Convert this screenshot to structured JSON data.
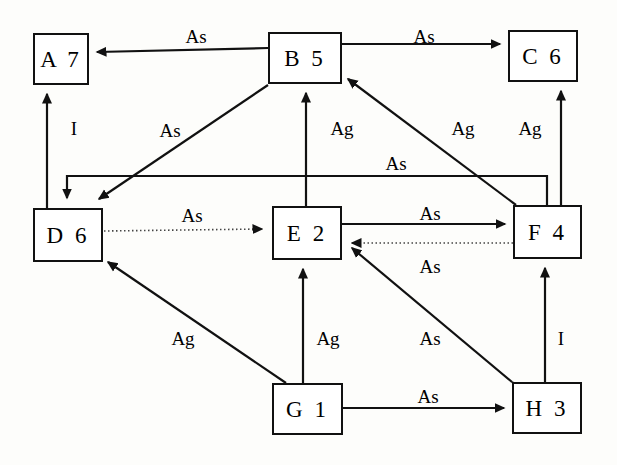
{
  "diagram": {
    "width": 617,
    "height": 465,
    "background_color": "#fdfdfb",
    "line_color": "#111111",
    "text_color": "#000000"
  },
  "nodes": [
    {
      "id": "A",
      "label": "A  7",
      "letter": "A",
      "number": "7",
      "x": 33,
      "y": 33,
      "w": 56,
      "h": 52
    },
    {
      "id": "B",
      "label": "B  5",
      "letter": "B",
      "number": "5",
      "x": 268,
      "y": 32,
      "w": 74,
      "h": 52
    },
    {
      "id": "C",
      "label": "C  6",
      "letter": "C",
      "number": "6",
      "x": 508,
      "y": 30,
      "w": 70,
      "h": 52
    },
    {
      "id": "D",
      "label": "D  6",
      "letter": "D",
      "number": "6",
      "x": 33,
      "y": 208,
      "w": 70,
      "h": 54
    },
    {
      "id": "E",
      "label": "E  2",
      "letter": "E",
      "number": "2",
      "x": 272,
      "y": 206,
      "w": 70,
      "h": 54
    },
    {
      "id": "F",
      "label": "F  4",
      "letter": "F",
      "number": "4",
      "x": 513,
      "y": 205,
      "w": 69,
      "h": 54
    },
    {
      "id": "G",
      "label": "G  1",
      "letter": "G",
      "number": "1",
      "x": 272,
      "y": 383,
      "w": 71,
      "h": 52
    },
    {
      "id": "H",
      "label": "H  3",
      "letter": "H",
      "number": "3",
      "x": 512,
      "y": 382,
      "w": 70,
      "h": 52
    }
  ],
  "edges": [
    {
      "id": "b-a",
      "from": "B",
      "to": "A",
      "label": "As",
      "style": "solid",
      "label_x": 196,
      "label_y": 36
    },
    {
      "id": "b-c",
      "from": "B",
      "to": "C",
      "label": "As",
      "style": "solid",
      "label_x": 424,
      "label_y": 36
    },
    {
      "id": "d-a",
      "from": "D",
      "to": "A",
      "label": "I",
      "style": "solid",
      "label_x": 74,
      "label_y": 128
    },
    {
      "id": "b-d",
      "from": "B",
      "to": "D",
      "label": "As",
      "style": "solid",
      "label_x": 170,
      "label_y": 130
    },
    {
      "id": "e-b",
      "from": "E",
      "to": "B",
      "label": "Ag",
      "style": "solid",
      "label_x": 342,
      "label_y": 128
    },
    {
      "id": "f-b",
      "from": "F",
      "to": "B",
      "label": "Ag",
      "style": "solid",
      "label_x": 463,
      "label_y": 128
    },
    {
      "id": "f-c",
      "from": "F",
      "to": "C",
      "label": "Ag",
      "style": "solid",
      "label_x": 530,
      "label_y": 128
    },
    {
      "id": "f-d",
      "from": "F",
      "to": "D",
      "label": "As",
      "style": "solid",
      "label_x": 396,
      "label_y": 163
    },
    {
      "id": "d-e",
      "from": "D",
      "to": "E",
      "label": "As",
      "style": "dotted",
      "label_x": 192,
      "label_y": 215
    },
    {
      "id": "e-f",
      "from": "E",
      "to": "F",
      "label": "As",
      "style": "solid",
      "label_x": 430,
      "label_y": 213
    },
    {
      "id": "f-e",
      "from": "F",
      "to": "E",
      "label": "As",
      "style": "dotted",
      "label_x": 430,
      "label_y": 266
    },
    {
      "id": "g-d",
      "from": "G",
      "to": "D",
      "label": "Ag",
      "style": "solid",
      "label_x": 183,
      "label_y": 338
    },
    {
      "id": "g-e",
      "from": "G",
      "to": "E",
      "label": "Ag",
      "style": "solid",
      "label_x": 328,
      "label_y": 338
    },
    {
      "id": "h-e",
      "from": "H",
      "to": "E",
      "label": "As",
      "style": "solid",
      "label_x": 430,
      "label_y": 338
    },
    {
      "id": "h-f",
      "from": "H",
      "to": "F",
      "label": "I",
      "style": "solid",
      "label_x": 561,
      "label_y": 338
    },
    {
      "id": "g-h",
      "from": "G",
      "to": "H",
      "label": "As",
      "style": "solid",
      "label_x": 428,
      "label_y": 396
    }
  ]
}
